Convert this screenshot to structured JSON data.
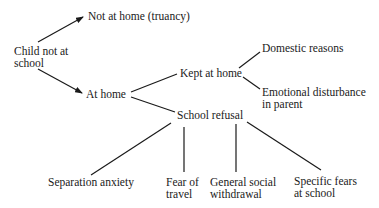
{
  "diagram": {
    "title": "",
    "nodes": {
      "root": {
        "lines": [
          "Child not at",
          "school"
        ]
      },
      "truancy": {
        "lines": [
          "Not at home (truancy)"
        ]
      },
      "at_home": {
        "lines": [
          "At home"
        ]
      },
      "kept_at_home": {
        "lines": [
          "Kept at home"
        ]
      },
      "domestic": {
        "lines": [
          "Domestic reasons"
        ]
      },
      "emotional": {
        "lines": [
          "Emotional disturbance",
          "in parent"
        ]
      },
      "school_refusal": {
        "lines": [
          "School refusal"
        ]
      },
      "separation": {
        "lines": [
          "Separation anxiety"
        ]
      },
      "fear_travel": {
        "lines": [
          "Fear of",
          "travel"
        ]
      },
      "withdrawal": {
        "lines": [
          "General social",
          "withdrawal"
        ]
      },
      "specific_fears": {
        "lines": [
          "Specific fears",
          "at school"
        ]
      }
    },
    "edges": [
      {
        "from": "root",
        "to": "truancy",
        "arrow": true
      },
      {
        "from": "root",
        "to": "at_home",
        "arrow": true
      },
      {
        "from": "at_home",
        "to": "kept_at_home",
        "arrow": false
      },
      {
        "from": "at_home",
        "to": "school_refusal",
        "arrow": false
      },
      {
        "from": "kept_at_home",
        "to": "domestic",
        "arrow": false
      },
      {
        "from": "kept_at_home",
        "to": "emotional",
        "arrow": false
      },
      {
        "from": "school_refusal",
        "to": "separation",
        "arrow": false
      },
      {
        "from": "school_refusal",
        "to": "fear_travel",
        "arrow": false
      },
      {
        "from": "school_refusal",
        "to": "withdrawal",
        "arrow": false
      },
      {
        "from": "school_refusal",
        "to": "specific_fears",
        "arrow": false
      }
    ],
    "colors": {
      "ink": "#1a1a1a",
      "background": "#ffffff"
    }
  }
}
